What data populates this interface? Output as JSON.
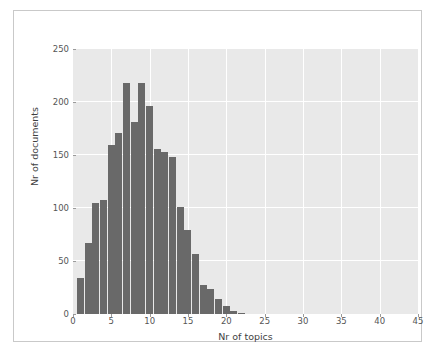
{
  "figure": {
    "background_color": "#ffffff",
    "border_color": "#c9c9c9",
    "plot_background_color": "#e9e9e9",
    "grid_color": "#ffffff",
    "bar_color": "#696969",
    "tick_label_color": "#555555",
    "axis_label_color": "#3f3f3f"
  },
  "chart_data": {
    "type": "bar",
    "title": "",
    "subtitle": "",
    "xlabel": "Nr of topics",
    "ylabel": "Nr of documents",
    "xlim": [
      0,
      45
    ],
    "ylim": [
      0,
      250
    ],
    "xticks": [
      0,
      5,
      10,
      15,
      20,
      25,
      30,
      35,
      40,
      45
    ],
    "xtick_labels": [
      "0",
      "5",
      "10",
      "15",
      "20",
      "25",
      "30",
      "35",
      "40",
      "45"
    ],
    "yticks": [
      0,
      50,
      100,
      150,
      200,
      250
    ],
    "ytick_labels": [
      "0",
      "50",
      "100",
      "150",
      "200",
      "250"
    ],
    "grid": true,
    "legend": null,
    "legend_position": "none",
    "bin_width": 1,
    "categories": [
      1,
      2,
      3,
      4,
      5,
      6,
      7,
      8,
      9,
      10,
      11,
      12,
      13,
      14,
      15,
      16,
      17,
      18,
      19,
      20,
      21,
      22
    ],
    "values": [
      34,
      67,
      105,
      108,
      159,
      171,
      218,
      181,
      218,
      196,
      156,
      153,
      148,
      101,
      79,
      57,
      27,
      24,
      14,
      8,
      3,
      1
    ],
    "series": [
      {
        "name": "Nr of documents",
        "values": [
          34,
          67,
          105,
          108,
          159,
          171,
          218,
          181,
          218,
          196,
          156,
          153,
          148,
          101,
          79,
          57,
          27,
          24,
          14,
          8,
          3,
          1
        ]
      }
    ],
    "annotations": []
  }
}
